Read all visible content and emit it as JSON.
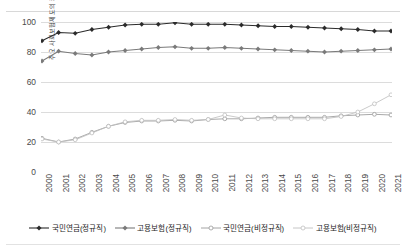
{
  "chart_data": {
    "type": "line",
    "title": "",
    "xlabel": "",
    "ylabel": "주요 사회보험제도의 커버리지",
    "ylim": [
      0,
      110
    ],
    "yticks": [
      0,
      20,
      40,
      60,
      80,
      100
    ],
    "grid": true,
    "legend_position": "bottom",
    "categories": [
      "2000",
      "2001",
      "2002",
      "2003",
      "2004",
      "2005",
      "2006",
      "2007",
      "2008",
      "2009",
      "2010",
      "2011",
      "2012",
      "2013",
      "2014",
      "2015",
      "2016",
      "2017",
      "2018",
      "2019",
      "2020",
      "2021"
    ],
    "series": [
      {
        "name": "국민연금(정규직)",
        "color": "#2b2b2b",
        "marker": "filled-diamond",
        "values": [
          87.5,
          93.0,
          92.5,
          95.0,
          96.5,
          98.0,
          98.5,
          98.5,
          99.5,
          98.5,
          98.5,
          98.5,
          98.0,
          97.5,
          97.0,
          97.0,
          96.5,
          96.0,
          95.5,
          95.0,
          94.0,
          94.0
        ]
      },
      {
        "name": "고용보험(정규직)",
        "color": "#7a7a7a",
        "marker": "filled-diamond",
        "values": [
          74.0,
          80.5,
          79.0,
          78.0,
          80.0,
          81.0,
          82.0,
          83.0,
          83.5,
          82.5,
          82.5,
          83.0,
          82.5,
          82.0,
          81.5,
          81.0,
          80.5,
          80.0,
          80.5,
          81.0,
          81.5,
          82.0
        ]
      },
      {
        "name": "국민연금(비정규직)",
        "color": "#9a9a9a",
        "marker": "open-circle",
        "values": [
          22.5,
          20.0,
          22.0,
          26.5,
          30.5,
          33.0,
          34.0,
          34.0,
          34.5,
          34.0,
          35.0,
          35.5,
          35.5,
          36.0,
          36.5,
          36.5,
          36.5,
          36.5,
          37.5,
          38.0,
          38.5,
          38.0
        ]
      },
      {
        "name": "고용보험(비정규직)",
        "color": "#c0c0c0",
        "marker": "open-circle",
        "values": [
          22.0,
          20.0,
          21.5,
          26.0,
          30.5,
          33.5,
          34.5,
          34.5,
          35.0,
          34.5,
          35.0,
          38.0,
          36.0,
          35.5,
          35.5,
          35.5,
          35.5,
          35.5,
          37.0,
          40.0,
          45.5,
          51.5
        ]
      }
    ]
  },
  "axes": {
    "y_label": "주요 사회보험제도의 커버리지",
    "y_tick_labels": [
      "0",
      "20",
      "40",
      "60",
      "80",
      "100"
    ],
    "x_tick_labels": [
      "2000",
      "2001",
      "2002",
      "2003",
      "2004",
      "2005",
      "2006",
      "2007",
      "2008",
      "2009",
      "2010",
      "2011",
      "2012",
      "2013",
      "2014",
      "2015",
      "2016",
      "2017",
      "2018",
      "2019",
      "2020",
      "2021"
    ]
  },
  "legend": {
    "items": [
      {
        "label": "국민연금(정규직)",
        "color": "#2b2b2b",
        "marker": "filled-diamond"
      },
      {
        "label": "고용보험(정규직)",
        "color": "#7a7a7a",
        "marker": "filled-diamond"
      },
      {
        "label": "국민연금(비정규직)",
        "color": "#9a9a9a",
        "marker": "open-circle"
      },
      {
        "label": "고용보험(비정규직)",
        "color": "#c0c0c0",
        "marker": "open-circle"
      }
    ]
  }
}
